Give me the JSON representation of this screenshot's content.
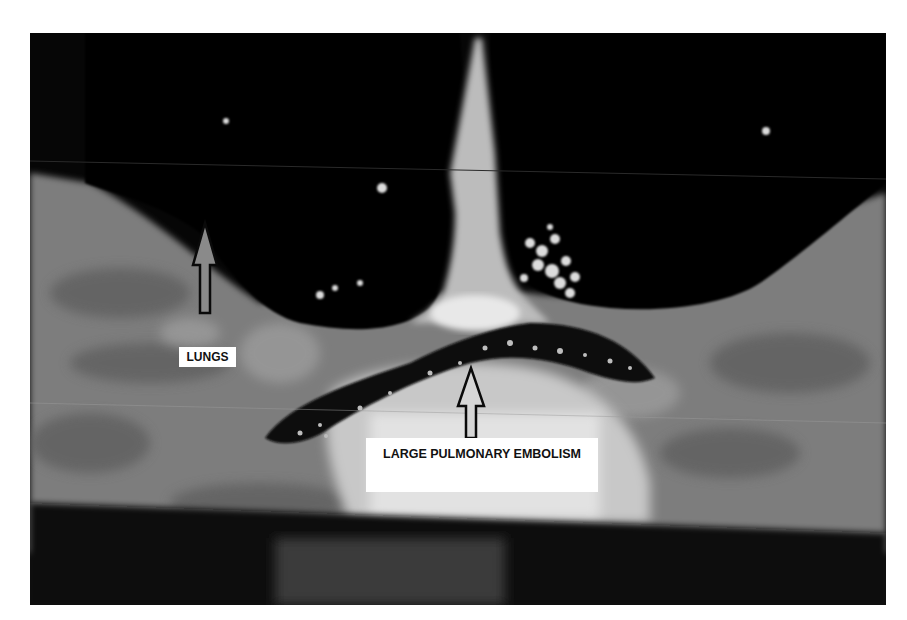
{
  "image": {
    "description": "Grayscale CT pulmonary angiogram (coronal) showing lungs and a large saddle pulmonary embolism",
    "background_color": "#ffffff",
    "photo_bg_color": "#060606"
  },
  "annotations": [
    {
      "id": "lungs",
      "text": "LUNGS",
      "arrow_direction": "up"
    },
    {
      "id": "pe",
      "text": "LARGE PULMONARY EMBOLISM",
      "arrow_direction": "up"
    }
  ],
  "labels": {
    "lungs": "LUNGS",
    "pe": "LARGE PULMONARY EMBOLISM"
  }
}
